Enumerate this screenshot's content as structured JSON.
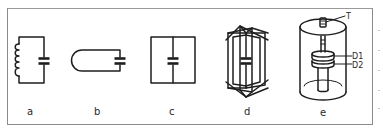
{
  "figure": {
    "panels": [
      {
        "id": "a",
        "label": "a",
        "description": "LC circuit: inductor coil on left, capacitor on right"
      },
      {
        "id": "b",
        "label": "b",
        "description": "single loop with rounded end and capacitor"
      },
      {
        "id": "c",
        "label": "c",
        "description": "square loop with central wire containing capacitor"
      },
      {
        "id": "d",
        "label": "d",
        "description": "multiple intersecting loops around central capacitor axis"
      },
      {
        "id": "e",
        "label": "e",
        "description": "cylindrical cavity resonator with tuning screw and disks",
        "annotations": [
          {
            "id": "T",
            "text": "T"
          },
          {
            "id": "D1",
            "text": "D1"
          },
          {
            "id": "D2",
            "text": "D2"
          }
        ]
      }
    ],
    "colors": {
      "line": "#1e1e1e",
      "frame": "#8a8a8a",
      "background": "#ffffff"
    }
  }
}
